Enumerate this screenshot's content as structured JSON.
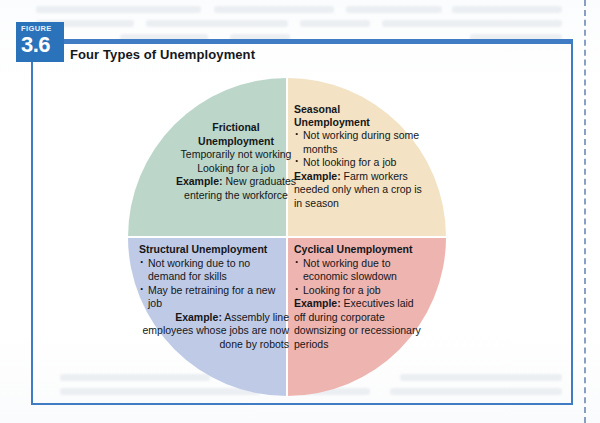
{
  "figure": {
    "badge_kicker": "FIGURE",
    "badge_number": "3.6",
    "title": "Four Types of Unemployment"
  },
  "colors": {
    "frame_blue": "#3f7cc4",
    "badge_blue": "#2a72ba",
    "quadrant_frictional": "#bcd6ca",
    "quadrant_seasonal": "#f3e2c3",
    "quadrant_structural": "#bfcae6",
    "quadrant_cyclical": "#eeb4b0",
    "divider_white": "#ffffff",
    "text_black": "#141619"
  },
  "diagram": {
    "type": "four-quadrant-circle",
    "quadrants": [
      {
        "id": "frictional",
        "position": "top-left",
        "heading_line1": "Frictional",
        "heading_line2": "Unemployment",
        "bullets": [
          "Temporarily not working",
          "Looking for a job"
        ],
        "example_label": "Example:",
        "example_text": "New graduates entering the workforce"
      },
      {
        "id": "seasonal",
        "position": "top-right",
        "heading_line1": "Seasonal",
        "heading_line2": "Unemployment",
        "bullets": [
          "Not working during some months",
          "Not looking for a job"
        ],
        "example_label": "Example:",
        "example_text": "Farm workers needed only when a crop is in season"
      },
      {
        "id": "structural",
        "position": "bottom-left",
        "heading_line1": "Structural Unemployment",
        "heading_line2": "",
        "bullets": [
          "Not working due to no demand for skills",
          "May be retraining for a new job"
        ],
        "example_label": "Example:",
        "example_text": "Assembly line employees whose jobs are now done by robots"
      },
      {
        "id": "cyclical",
        "position": "bottom-right",
        "heading_line1": "Cyclical Unemployment",
        "heading_line2": "",
        "bullets": [
          "Not working due to economic slowdown",
          "Looking for a job"
        ],
        "example_label": "Example:",
        "example_text": "Executives laid off during corporate downsizing or recessionary periods"
      }
    ]
  }
}
